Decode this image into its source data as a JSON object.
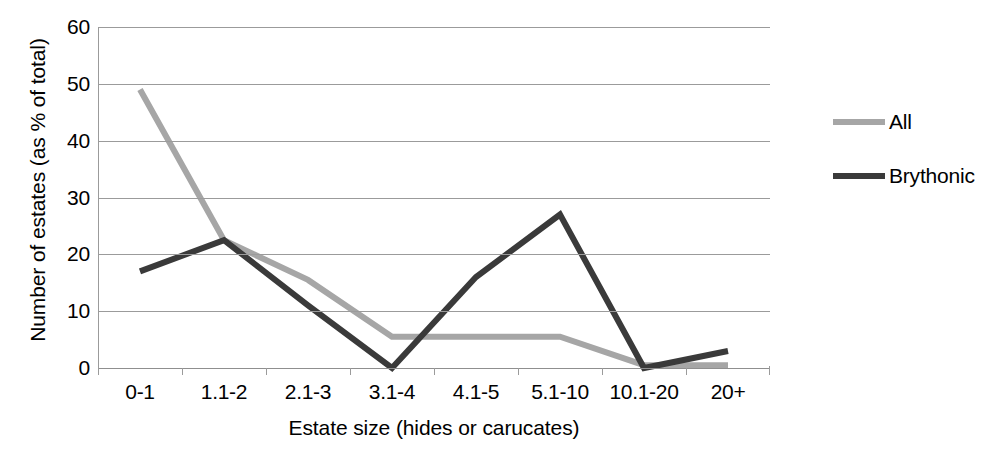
{
  "chart_data": {
    "type": "line",
    "title": "",
    "xlabel": "Estate size (hides or carucates)",
    "ylabel": "Number of estates (as % of total)",
    "categories": [
      "0-1",
      "1.1-2",
      "2.1-3",
      "3.1-4",
      "4.1-5",
      "5.1-10",
      "10.1-20",
      "20+"
    ],
    "ylim": [
      0,
      60
    ],
    "y_ticks": [
      0,
      10,
      20,
      30,
      40,
      50,
      60
    ],
    "grid": "horizontal",
    "legend_position": "right",
    "series": [
      {
        "name": "All",
        "color": "#a6a6a6",
        "values": [
          49,
          22.5,
          15.5,
          5.5,
          5.5,
          5.5,
          0.5,
          0.5
        ]
      },
      {
        "name": "Brythonic",
        "color": "#3a3a3a",
        "values": [
          17,
          22.5,
          11,
          0,
          16,
          27,
          0,
          3
        ]
      }
    ]
  }
}
